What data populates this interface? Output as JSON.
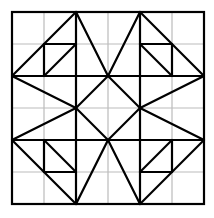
{
  "diagram": {
    "grid": {
      "origin": [
        12,
        12
      ],
      "cell": 32,
      "cols": 6,
      "rows": 6,
      "color": "#bbbbbb"
    },
    "stroke_color": "#000000",
    "lines": [
      [
        76,
        12,
        76,
        204
      ],
      [
        140,
        12,
        140,
        204
      ],
      [
        12,
        76,
        204,
        76
      ],
      [
        12,
        140,
        204,
        140
      ],
      [
        76,
        12,
        12,
        76
      ],
      [
        76,
        12,
        108,
        76
      ],
      [
        140,
        12,
        108,
        76
      ],
      [
        140,
        12,
        204,
        76
      ],
      [
        12,
        76,
        76,
        108
      ],
      [
        204,
        76,
        140,
        108
      ],
      [
        108,
        76,
        76,
        108
      ],
      [
        108,
        76,
        140,
        108
      ],
      [
        76,
        108,
        108,
        140
      ],
      [
        140,
        108,
        108,
        140
      ],
      [
        12,
        140,
        76,
        108
      ],
      [
        204,
        140,
        140,
        108
      ],
      [
        12,
        140,
        76,
        204
      ],
      [
        108,
        140,
        76,
        204
      ],
      [
        108,
        140,
        140,
        204
      ],
      [
        204,
        140,
        140,
        204
      ],
      [
        44,
        44,
        76,
        44
      ],
      [
        44,
        44,
        44,
        76
      ],
      [
        76,
        44,
        44,
        76
      ],
      [
        140,
        44,
        172,
        44
      ],
      [
        172,
        44,
        172,
        76
      ],
      [
        140,
        44,
        172,
        76
      ],
      [
        44,
        140,
        44,
        172
      ],
      [
        44,
        172,
        76,
        172
      ],
      [
        44,
        140,
        76,
        172
      ],
      [
        172,
        140,
        172,
        172
      ],
      [
        140,
        172,
        172,
        172
      ],
      [
        172,
        140,
        140,
        172
      ]
    ]
  }
}
